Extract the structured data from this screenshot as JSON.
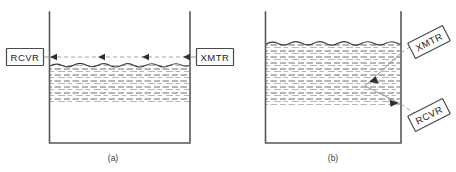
{
  "figure": {
    "type": "technical-diagram",
    "width": 456,
    "height": 172,
    "background_color": "#ffffff"
  },
  "panels": [
    {
      "id": "a",
      "caption": "(a)",
      "caption_x": 113,
      "caption_y": 160,
      "tank": {
        "left_x": 49,
        "right_x": 190,
        "top_y": 12,
        "bottom_y": 143,
        "wall_color": "#58585a"
      },
      "liquid": {
        "surface_y": 65,
        "bottom_y": 103,
        "hatch_color": "#6e6e72",
        "surface_color": "#3a3a3c",
        "wavy": true
      },
      "beam": {
        "mode": "through-transmission",
        "path_y": 57,
        "style": "dashed",
        "direction": "right-to-left",
        "arrow_x_positions": [
          64,
          104,
          146,
          186
        ],
        "color": "#9a9a9e"
      },
      "devices": [
        {
          "label": "RCVR",
          "name": "receiver",
          "x": 6,
          "y": 48,
          "width": 38,
          "height": 18,
          "rotation": 0
        },
        {
          "label": "XMTR",
          "name": "transmitter",
          "x": 196,
          "y": 48,
          "width": 38,
          "height": 18,
          "rotation": 0
        }
      ]
    },
    {
      "id": "b",
      "caption": "(b)",
      "caption_x": 333,
      "caption_y": 160,
      "tank": {
        "left_x": 265,
        "right_x": 401,
        "top_y": 12,
        "bottom_y": 143,
        "wall_color": "#58585a"
      },
      "liquid": {
        "surface_y": 43,
        "bottom_y": 105,
        "hatch_color": "#6e6e72",
        "surface_color": "#3a3a3c",
        "wavy": true
      },
      "beam": {
        "mode": "pulse-echo-reflection",
        "style": "solid-with-dashed-leaders",
        "vertices": [
          [
            401,
            53
          ],
          [
            365,
            86
          ],
          [
            401,
            104
          ]
        ],
        "color": "#8c8c90",
        "arrow_points": [
          {
            "x": 373,
            "y": 79,
            "angle": 222
          },
          {
            "x": 396,
            "y": 101,
            "angle": 27
          }
        ]
      },
      "devices": [
        {
          "label": "XMTR",
          "name": "transmitter",
          "x": 409,
          "y": 33,
          "width": 40,
          "height": 18,
          "rotation": -27
        },
        {
          "label": "RCVR",
          "name": "receiver",
          "x": 409,
          "y": 106,
          "width": 40,
          "height": 18,
          "rotation": -27
        }
      ]
    }
  ]
}
